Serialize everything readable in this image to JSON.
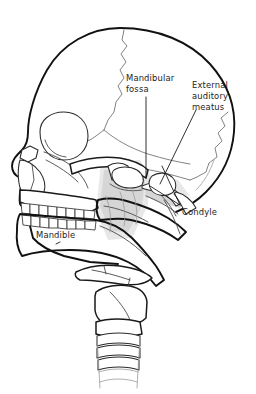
{
  "figure": {
    "background_color": "#ffffff",
    "ink_color": "#1a1a1a",
    "suture_color": "#6d6d6d",
    "shading_color": "#d6d6d6"
  },
  "labels": [
    {
      "id": "mandibular-fossa",
      "text": "Mandibular\nfossa",
      "line1": "Mandibular",
      "line2": "fossa",
      "x": 126,
      "y": 73,
      "leader": "vertical-down"
    },
    {
      "id": "external-auditory-meatus",
      "text": "External\nauditory\nmeatus",
      "line1": "External",
      "line2": "auditory",
      "line3": "meatus",
      "x": 192,
      "y": 80,
      "leader": "diagonal-down-left"
    },
    {
      "id": "condyle",
      "text": "Condyle",
      "line1": "Condyle",
      "x": 182,
      "y": 207,
      "leader": "diagonal-up-left"
    },
    {
      "id": "mandible",
      "text": "Mandible",
      "line1": "Mandible",
      "x": 36,
      "y": 230,
      "leader": "short-tick-below"
    }
  ],
  "structures": [
    {
      "id": "cranial-vault",
      "name": "Cranial vault"
    },
    {
      "id": "frontal-bone",
      "name": "Frontal bone"
    },
    {
      "id": "parietal-bone",
      "name": "Parietal bone"
    },
    {
      "id": "occipital-bone",
      "name": "Occipital bone"
    },
    {
      "id": "temporal-bone",
      "name": "Temporal bone"
    },
    {
      "id": "coronal-suture",
      "name": "Coronal suture"
    },
    {
      "id": "lambdoid-suture",
      "name": "Lambdoid suture"
    },
    {
      "id": "squamous-suture",
      "name": "Squamous suture"
    },
    {
      "id": "orbit",
      "name": "Orbit"
    },
    {
      "id": "nasal-aperture",
      "name": "Nasal aperture"
    },
    {
      "id": "zygomatic-arch",
      "name": "Zygomatic arch"
    },
    {
      "id": "maxilla",
      "name": "Maxilla"
    },
    {
      "id": "maxillary-teeth",
      "name": "Maxillary teeth"
    },
    {
      "id": "mandibular-teeth",
      "name": "Mandibular teeth"
    },
    {
      "id": "mandible-body",
      "name": "Body of mandible"
    },
    {
      "id": "mandibular-ramus",
      "name": "Ramus of mandible"
    },
    {
      "id": "mandibular-condyle",
      "name": "Mandibular condyle"
    },
    {
      "id": "mandibular-fossa",
      "name": "Mandibular fossa"
    },
    {
      "id": "external-auditory-meatus",
      "name": "External auditory meatus"
    },
    {
      "id": "mastoid-process",
      "name": "Mastoid process"
    },
    {
      "id": "styloid-process",
      "name": "Styloid process"
    },
    {
      "id": "hyoid-bone",
      "name": "Hyoid bone"
    },
    {
      "id": "thyroid-cartilage",
      "name": "Thyroid cartilage"
    },
    {
      "id": "cricoid-cartilage",
      "name": "Cricoid cartilage"
    },
    {
      "id": "tracheal-rings",
      "name": "Tracheal rings"
    }
  ],
  "teeth": {
    "maxillary_count": 8,
    "mandibular_count": 8
  },
  "trachea": {
    "ring_count": 6
  }
}
